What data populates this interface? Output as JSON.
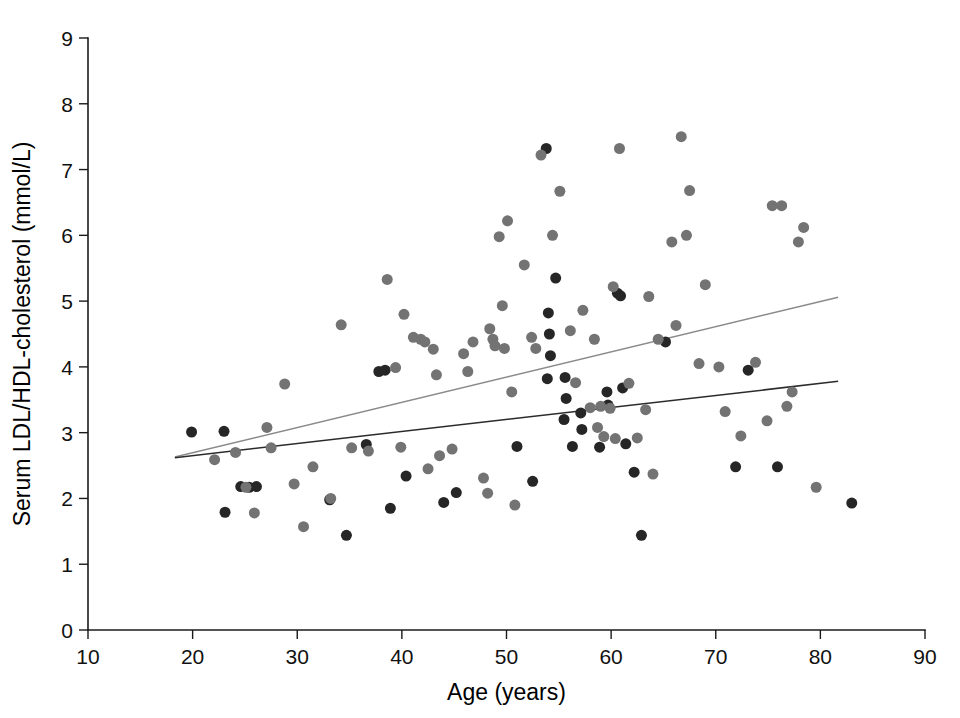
{
  "chart_data": {
    "type": "scatter",
    "title": "",
    "xlabel": "Age (years)",
    "ylabel": "Serum LDL/HDL-cholesterol  (mmol/L)",
    "xlim": [
      10,
      90
    ],
    "ylim": [
      0,
      9
    ],
    "xticks": [
      10,
      20,
      30,
      40,
      50,
      60,
      70,
      80,
      90
    ],
    "yticks": [
      0,
      1,
      2,
      3,
      4,
      5,
      6,
      7,
      8,
      9
    ],
    "grid": false,
    "legend": "none",
    "colors": {
      "group_dark": "#262626",
      "group_gray": "#737373",
      "fit_line_gray": "#8a8a8a",
      "fit_line_dark": "#2b2b2b",
      "axis": "#1a1a1a",
      "background": "#ffffff"
    },
    "marker": {
      "shape": "circle",
      "diameter_px": 11
    },
    "series": [
      {
        "name": "group-dark",
        "color": "#262626",
        "points": [
          [
            19.9,
            3.01
          ],
          [
            23.0,
            3.02
          ],
          [
            23.1,
            1.79
          ],
          [
            24.6,
            2.18
          ],
          [
            25.4,
            2.17
          ],
          [
            26.1,
            2.18
          ],
          [
            33.1,
            1.98
          ],
          [
            34.7,
            1.44
          ],
          [
            37.8,
            3.93
          ],
          [
            38.4,
            3.95
          ],
          [
            38.9,
            1.85
          ],
          [
            36.6,
            2.82
          ],
          [
            40.4,
            2.34
          ],
          [
            44.0,
            1.94
          ],
          [
            45.2,
            2.09
          ],
          [
            53.8,
            7.32
          ],
          [
            54.7,
            5.35
          ],
          [
            54.0,
            4.82
          ],
          [
            54.1,
            4.5
          ],
          [
            54.2,
            4.17
          ],
          [
            53.9,
            3.82
          ],
          [
            55.6,
            3.84
          ],
          [
            55.7,
            3.52
          ],
          [
            55.5,
            3.2
          ],
          [
            56.3,
            2.79
          ],
          [
            57.1,
            3.3
          ],
          [
            57.2,
            3.05
          ],
          [
            58.9,
            2.78
          ],
          [
            59.6,
            3.62
          ],
          [
            59.7,
            3.42
          ],
          [
            60.6,
            5.12
          ],
          [
            60.9,
            5.08
          ],
          [
            61.1,
            3.68
          ],
          [
            61.4,
            2.83
          ],
          [
            62.2,
            2.4
          ],
          [
            62.9,
            1.44
          ],
          [
            65.2,
            4.38
          ],
          [
            71.9,
            2.48
          ],
          [
            73.1,
            3.95
          ],
          [
            75.9,
            2.48
          ],
          [
            83.0,
            1.93
          ],
          [
            51.0,
            2.79
          ],
          [
            52.5,
            2.26
          ]
        ]
      },
      {
        "name": "group-gray",
        "color": "#737373",
        "points": [
          [
            22.1,
            2.59
          ],
          [
            24.1,
            2.7
          ],
          [
            25.1,
            2.17
          ],
          [
            25.9,
            1.78
          ],
          [
            27.1,
            3.08
          ],
          [
            27.5,
            2.77
          ],
          [
            28.8,
            3.74
          ],
          [
            29.7,
            2.22
          ],
          [
            30.6,
            1.57
          ],
          [
            31.5,
            2.48
          ],
          [
            33.2,
            2.0
          ],
          [
            34.2,
            4.64
          ],
          [
            35.2,
            2.77
          ],
          [
            36.8,
            2.72
          ],
          [
            38.6,
            5.33
          ],
          [
            39.4,
            3.99
          ],
          [
            39.9,
            2.78
          ],
          [
            40.2,
            4.8
          ],
          [
            41.8,
            4.42
          ],
          [
            42.2,
            4.38
          ],
          [
            42.5,
            2.45
          ],
          [
            43.0,
            4.27
          ],
          [
            43.3,
            3.88
          ],
          [
            43.6,
            2.65
          ],
          [
            44.8,
            2.75
          ],
          [
            45.9,
            4.2
          ],
          [
            46.3,
            3.93
          ],
          [
            47.8,
            2.31
          ],
          [
            48.2,
            2.08
          ],
          [
            48.4,
            4.58
          ],
          [
            48.7,
            4.42
          ],
          [
            48.9,
            4.32
          ],
          [
            49.3,
            5.98
          ],
          [
            49.6,
            4.93
          ],
          [
            49.8,
            4.28
          ],
          [
            50.1,
            6.22
          ],
          [
            50.5,
            3.62
          ],
          [
            50.8,
            1.9
          ],
          [
            51.7,
            5.55
          ],
          [
            52.4,
            4.45
          ],
          [
            52.8,
            4.28
          ],
          [
            53.3,
            7.22
          ],
          [
            54.4,
            6.0
          ],
          [
            55.1,
            6.67
          ],
          [
            56.1,
            4.55
          ],
          [
            56.6,
            3.76
          ],
          [
            57.3,
            4.86
          ],
          [
            58.0,
            3.38
          ],
          [
            58.4,
            4.42
          ],
          [
            58.7,
            3.08
          ],
          [
            59.0,
            3.4
          ],
          [
            59.3,
            2.94
          ],
          [
            59.9,
            3.37
          ],
          [
            60.2,
            5.22
          ],
          [
            60.4,
            2.91
          ],
          [
            60.8,
            7.32
          ],
          [
            61.7,
            3.75
          ],
          [
            62.5,
            2.92
          ],
          [
            63.3,
            3.35
          ],
          [
            64.0,
            2.37
          ],
          [
            64.5,
            4.42
          ],
          [
            65.8,
            5.9
          ],
          [
            66.2,
            4.63
          ],
          [
            66.7,
            7.5
          ],
          [
            67.2,
            6.0
          ],
          [
            67.5,
            6.68
          ],
          [
            68.4,
            4.05
          ],
          [
            69.0,
            5.25
          ],
          [
            70.3,
            4.0
          ],
          [
            70.9,
            3.32
          ],
          [
            72.4,
            2.95
          ],
          [
            73.8,
            4.07
          ],
          [
            74.9,
            3.18
          ],
          [
            75.4,
            6.45
          ],
          [
            76.3,
            6.45
          ],
          [
            76.8,
            3.4
          ],
          [
            77.3,
            3.62
          ],
          [
            77.9,
            5.9
          ],
          [
            78.4,
            6.12
          ],
          [
            79.6,
            2.17
          ],
          [
            63.6,
            5.07
          ],
          [
            46.8,
            4.38
          ],
          [
            41.1,
            4.45
          ]
        ]
      }
    ],
    "fit_lines": [
      {
        "name": "upper-regression-line",
        "color": "#8a8a8a",
        "x0": 18.3,
        "y0": 2.63,
        "x1": 81.7,
        "y1": 5.06
      },
      {
        "name": "lower-regression-line",
        "color": "#2b2b2b",
        "x0": 18.3,
        "y0": 2.62,
        "x1": 81.7,
        "y1": 3.78
      }
    ]
  }
}
